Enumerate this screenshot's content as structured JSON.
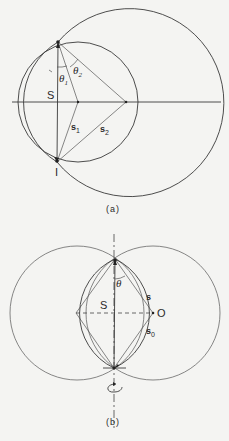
{
  "figure_a": {
    "caption": "(a)",
    "labels": {
      "S": "S",
      "I": "I",
      "theta1": "θ",
      "theta1_sub": "1",
      "theta2": "θ",
      "theta2_sub": "2",
      "s1": "s",
      "s1_sub": "1",
      "s2": "s",
      "s2_sub": "2"
    }
  },
  "figure_b": {
    "caption": "(b)",
    "labels": {
      "S": "S",
      "theta": "θ",
      "s": "s",
      "O": "O",
      "s0": "s",
      "s0_sub": "0"
    }
  }
}
